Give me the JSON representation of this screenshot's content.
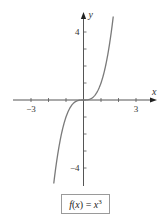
{
  "chart_data": {
    "type": "line",
    "title": "",
    "function": "x^3",
    "legend": "f(x) = x^3",
    "legend_parts": {
      "lhs": "f(x) = ",
      "base": "x",
      "exp": "3"
    },
    "xlabel": "x",
    "ylabel": "y",
    "xlim": [
      -4,
      4
    ],
    "ylim": [
      -5,
      5
    ],
    "x_ticks": [
      -3,
      -2,
      -1,
      1,
      2,
      3
    ],
    "y_ticks": [
      -4,
      -3,
      -2,
      -1,
      1,
      2,
      3,
      4
    ],
    "x_tick_labels": [
      {
        "value": -3,
        "label": "−3"
      },
      {
        "value": 3,
        "label": "3"
      }
    ],
    "y_tick_labels": [
      {
        "value": 4,
        "label": "4"
      },
      {
        "value": -4,
        "label": "−4"
      }
    ],
    "grid": false,
    "series": [
      {
        "name": "f(x) = x^3",
        "x": [
          -1.7,
          -1.5,
          -1.25,
          -1.0,
          -0.75,
          -0.5,
          -0.25,
          0,
          0.25,
          0.5,
          0.75,
          1.0,
          1.25,
          1.5,
          1.7
        ],
        "y": [
          -4.913,
          -3.375,
          -1.953,
          -1.0,
          -0.422,
          -0.125,
          -0.016,
          0,
          0.016,
          0.125,
          0.422,
          1.0,
          1.953,
          3.375,
          4.913
        ]
      }
    ],
    "domain_plotted": [
      -1.7,
      1.7
    ],
    "colors": {
      "curve": "#7a7a7a",
      "axes": "#555555",
      "box_border": "#9a9a9a"
    }
  },
  "layout": {
    "origin_px": [
      83.5,
      100
    ],
    "unit_x_px": 17.5,
    "unit_y_px": 17,
    "x_axis_px": [
      13,
      157
    ],
    "y_axis_px": [
      12,
      186
    ]
  }
}
